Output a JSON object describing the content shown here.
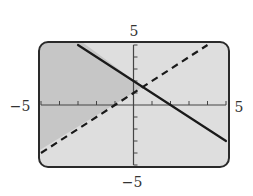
{
  "chart_data": {
    "type": "line",
    "title": "",
    "subtitle": "Graphing calculator display of a system of linear inequalities",
    "xlabel": "",
    "ylabel": "",
    "xlim": [
      -5,
      5
    ],
    "ylim": [
      -5,
      5
    ],
    "x_tick_step": 1,
    "y_tick_step": 1,
    "grid": false,
    "legend": null,
    "axis_labels": {
      "x_min": "−5",
      "x_max": "5",
      "y_min": "−5",
      "y_max": "5"
    },
    "series": [
      {
        "name": "solid boundary",
        "style": "solid",
        "equation": "y = -x + 2",
        "slope": -1,
        "intercept": 2,
        "x": [
          -3,
          5
        ],
        "y": [
          5,
          -3
        ]
      },
      {
        "name": "dashed boundary",
        "style": "dashed",
        "equation": "y = x + 1",
        "slope": 1,
        "intercept": 1,
        "x": [
          -5,
          4
        ],
        "y": [
          -4,
          5
        ]
      }
    ],
    "shaded_region": {
      "description": "upper-left region above the dashed line and below/left of the solid line",
      "inequalities": [
        "y > x + 1",
        "y <= -x + 2"
      ],
      "vertices": [
        [
          -5,
          5
        ],
        [
          -3,
          5
        ],
        [
          0.5,
          1.5
        ],
        [
          -5,
          -4
        ]
      ]
    },
    "intersection": [
      0.5,
      1.5
    ]
  },
  "colors": {
    "screen_bg": "#dedede",
    "shaded": "#c6c6c6",
    "frame": "#2a2a2a",
    "axis": "#444444",
    "line": "#1a1a1a"
  }
}
